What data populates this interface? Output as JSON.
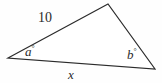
{
  "figure": {
    "type": "triangle-diagram",
    "stroke_color": "#2b2b2b",
    "background_color": "#fefefe",
    "vertices": {
      "left": {
        "x": 8,
        "y": 58
      },
      "top": {
        "x": 108,
        "y": 4
      },
      "right": {
        "x": 155,
        "y": 69
      }
    },
    "labels": {
      "side_upper_left": "10",
      "side_bottom": "x",
      "angle_left": "a",
      "angle_right": "b",
      "degree_symbol": "°"
    }
  },
  "chart_data": {
    "type": "diagram",
    "title": "",
    "shape": "triangle",
    "sides": [
      {
        "name": "upper-left side",
        "from": "left",
        "to": "top",
        "label": "10",
        "known": true
      },
      {
        "name": "bottom side",
        "from": "left",
        "to": "right",
        "label": "x",
        "known": false
      },
      {
        "name": "right side",
        "from": "top",
        "to": "right",
        "label": "",
        "known": false
      }
    ],
    "angles": [
      {
        "vertex": "left",
        "label": "a°"
      },
      {
        "vertex": "right",
        "label": "b°"
      }
    ]
  }
}
